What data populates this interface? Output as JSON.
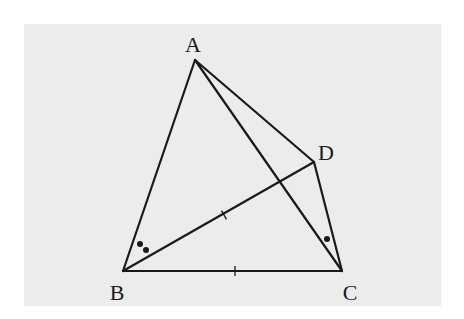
{
  "diagram": {
    "background_color": "#ececec",
    "line_color": "#1a1a1a",
    "panel": {
      "x": 24,
      "y": 24,
      "width": 417,
      "height": 282
    },
    "points": {
      "A": {
        "label": "A",
        "x": 195,
        "y": 60,
        "label_x": 193,
        "label_y": 52
      },
      "B": {
        "label": "B",
        "x": 123,
        "y": 271,
        "label_x": 117,
        "label_y": 300
      },
      "C": {
        "label": "C",
        "x": 342,
        "y": 271,
        "label_x": 350,
        "label_y": 300
      },
      "D": {
        "label": "D",
        "x": 314,
        "y": 162,
        "label_x": 326,
        "label_y": 160
      }
    },
    "segments": [
      {
        "name": "AB",
        "from": "A",
        "to": "B"
      },
      {
        "name": "AC",
        "from": "A",
        "to": "C"
      },
      {
        "name": "AD",
        "from": "A",
        "to": "D"
      },
      {
        "name": "BC",
        "from": "B",
        "to": "C"
      },
      {
        "name": "BD",
        "from": "B",
        "to": "D"
      },
      {
        "name": "DC",
        "from": "D",
        "to": "C"
      }
    ],
    "equal_marks": [
      {
        "segment": "BD",
        "count": 1,
        "x": 224,
        "y": 215
      },
      {
        "segment": "BC",
        "count": 1,
        "x": 235,
        "y": 271
      }
    ],
    "angle_marks": [
      {
        "vertex": "B",
        "angle": "ABD",
        "dots": 2,
        "positions": [
          [
            140,
            244
          ],
          [
            146,
            250
          ]
        ]
      },
      {
        "vertex": "C",
        "angle": "ACD",
        "dots": 1,
        "positions": [
          [
            327,
            239
          ]
        ]
      }
    ]
  }
}
